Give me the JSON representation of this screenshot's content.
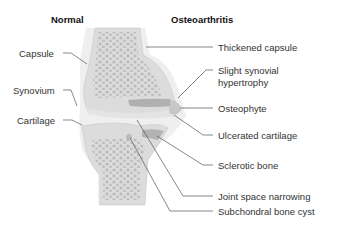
{
  "titles": {
    "left": "Normal",
    "right": "Osteoarthritis"
  },
  "labels_left": [
    {
      "id": "capsule",
      "text": "Capsule"
    },
    {
      "id": "synovium",
      "text": "Synovium"
    },
    {
      "id": "cartilage",
      "text": "Cartilage"
    }
  ],
  "labels_right": [
    {
      "id": "thickened-capsule",
      "text": "Thickened capsule"
    },
    {
      "id": "slight-synovial-hypertrophy",
      "line1": "Slight synovial",
      "line2": "hypertrophy"
    },
    {
      "id": "osteophyte",
      "text": "Osteophyte"
    },
    {
      "id": "ulcerated-cartilage",
      "text": "Ulcerated cartilage"
    },
    {
      "id": "sclerotic-bone",
      "text": "Sclerotic bone"
    },
    {
      "id": "joint-space-narrowing",
      "text": "Joint space narrowing"
    },
    {
      "id": "subchondral-bone-cyst",
      "text": "Subchondral bone cyst"
    }
  ],
  "colors": {
    "bone_fill": "#d9d9d9",
    "bone_pores": "#b5b5b5",
    "capsule": "#ececec",
    "sclerotic": "#a8a8a8",
    "leader_line": "#555555"
  }
}
